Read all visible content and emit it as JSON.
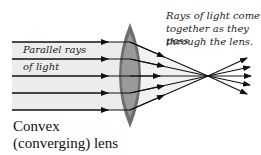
{
  "diagram": {
    "title_line1": "Convex",
    "title_line2": "(converging) lens",
    "label_incoming_line1": "Parallel rays",
    "label_incoming_line2": "of light",
    "label_outgoing_line1": "Rays of light come",
    "label_outgoing_line2": "together as they pass",
    "label_outgoing_line3": "through the lens.",
    "ray_count": 5,
    "colors": {
      "lens_edge": "#6e6e6e",
      "lens_center": "#9a9a9a",
      "beam_fill": "#ececec",
      "ray": "#111111"
    }
  }
}
